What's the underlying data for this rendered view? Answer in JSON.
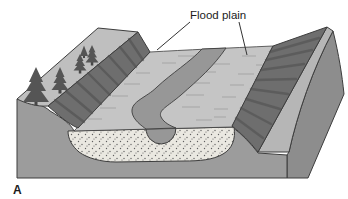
{
  "figure": {
    "label_flood_plain": "Flood plain",
    "panel_letter": "A"
  },
  "colors": {
    "background": "#ffffff",
    "plain": "#c5c5c5",
    "plain_texture": "#a9a9a9",
    "channel": "#979797",
    "upland": "#bfbfbf",
    "wall": "#6e6e6e",
    "wall_texture": "#4c4c4c",
    "front_face": "#9c9c9c",
    "side_face": "#8d8d8d",
    "ridge_strip": "#b6b6b6",
    "sediment_fill": "#eae8e1",
    "sediment_dots": "#5f5f5f",
    "outline": "#3d3d3d",
    "tree": "#555555",
    "tree_trunk": "#474747",
    "label_text": "#1c1c1c"
  }
}
